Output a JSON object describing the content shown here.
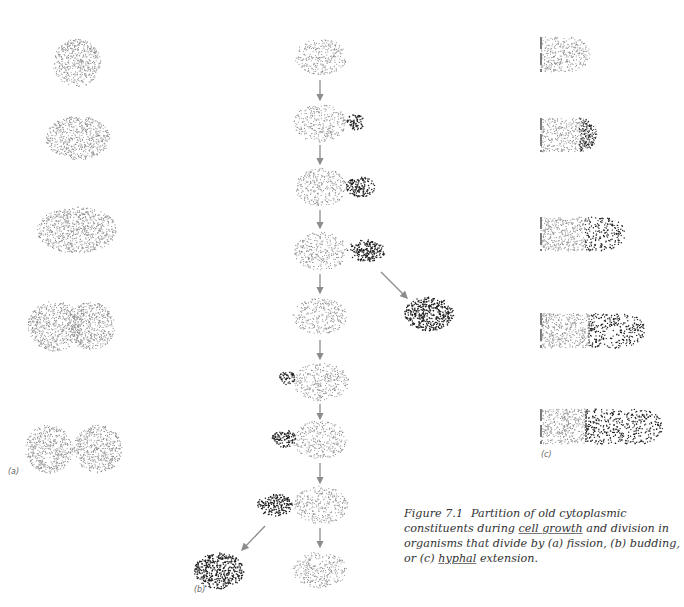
{
  "figure": {
    "number": "Figure 7.1",
    "caption_parts": [
      {
        "text": "Partition of old cytoplasmic constituents during ",
        "u": false
      },
      {
        "text": "cell growth",
        "u": true
      },
      {
        "text": " and division in organisms that divide by (a) fission, (b) budding, or (c) ",
        "u": false
      },
      {
        "text": "hyphal",
        "u": true
      },
      {
        "text": " extension.",
        "u": false
      }
    ],
    "caption_lines": [
      "Partition of old cytoplasmic",
      "constituents during cell growth and",
      "division in organisms that divide by (a)",
      "fission, (b) budding, or (c) hyphal extension."
    ]
  },
  "panels": {
    "a": {
      "label": "(a)",
      "label_x": 8,
      "label_y": 475
    },
    "b": {
      "label": "(b)",
      "label_x": 194,
      "label_y": 593
    },
    "c": {
      "label": "(c)",
      "label_x": 541,
      "label_y": 458
    }
  },
  "colors": {
    "old_dots": "#8a8a8a",
    "new_dots": "#1e1e1e",
    "arrow": "#8c8c8c",
    "wall": "#444444",
    "text": "#333333"
  },
  "shapes": {
    "fission": [
      {
        "cx": 77,
        "cy": 63,
        "rx": 24,
        "ry": 24,
        "type": "old"
      },
      {
        "cx": 78,
        "cy": 138,
        "rx": 32,
        "ry": 22,
        "type": "old"
      },
      {
        "cx": 77,
        "cy": 230,
        "rx": 40,
        "ry": 23,
        "type": "old"
      },
      {
        "cx": 55,
        "cy": 326,
        "rx": 27,
        "ry": 25,
        "type": "old"
      },
      {
        "cx": 91,
        "cy": 326,
        "rx": 24,
        "ry": 24,
        "type": "old"
      },
      {
        "cx": 49,
        "cy": 449,
        "rx": 24,
        "ry": 24,
        "type": "old"
      },
      {
        "cx": 98,
        "cy": 449,
        "rx": 24,
        "ry": 24,
        "type": "old"
      }
    ],
    "budding": [
      {
        "cx": 321,
        "cy": 57,
        "rx": 26,
        "ry": 18,
        "type": "old"
      },
      {
        "cx": 320,
        "cy": 123,
        "rx": 26,
        "ry": 19,
        "type": "old"
      },
      {
        "cx": 356,
        "cy": 122,
        "rx": 9,
        "ry": 8,
        "type": "new"
      },
      {
        "cx": 321,
        "cy": 187,
        "rx": 26,
        "ry": 19,
        "type": "old"
      },
      {
        "cx": 361,
        "cy": 187,
        "rx": 15,
        "ry": 10,
        "type": "new"
      },
      {
        "cx": 321,
        "cy": 251,
        "rx": 27,
        "ry": 19,
        "type": "old"
      },
      {
        "cx": 366,
        "cy": 251,
        "rx": 19,
        "ry": 11,
        "type": "new"
      },
      {
        "cx": 320,
        "cy": 316,
        "rx": 27,
        "ry": 18,
        "type": "old"
      },
      {
        "cx": 429,
        "cy": 314,
        "rx": 25,
        "ry": 17,
        "type": "new"
      },
      {
        "cx": 321,
        "cy": 382,
        "rx": 28,
        "ry": 19,
        "type": "old"
      },
      {
        "cx": 287,
        "cy": 378,
        "rx": 8,
        "ry": 7,
        "type": "new"
      },
      {
        "cx": 320,
        "cy": 440,
        "rx": 27,
        "ry": 19,
        "type": "old"
      },
      {
        "cx": 284,
        "cy": 439,
        "rx": 12,
        "ry": 9,
        "type": "new"
      },
      {
        "cx": 321,
        "cy": 505,
        "rx": 27,
        "ry": 19,
        "type": "old"
      },
      {
        "cx": 275,
        "cy": 505,
        "rx": 18,
        "ry": 11,
        "type": "new"
      },
      {
        "cx": 219,
        "cy": 571,
        "rx": 25,
        "ry": 18,
        "type": "new"
      },
      {
        "cx": 320,
        "cy": 570,
        "rx": 27,
        "ry": 18,
        "type": "old"
      }
    ],
    "arrows": [
      {
        "x1": 320,
        "y1": 80,
        "x2": 320,
        "y2": 100
      },
      {
        "x1": 320,
        "y1": 145,
        "x2": 320,
        "y2": 164
      },
      {
        "x1": 320,
        "y1": 210,
        "x2": 320,
        "y2": 228
      },
      {
        "x1": 320,
        "y1": 274,
        "x2": 320,
        "y2": 293
      },
      {
        "x1": 381,
        "y1": 272,
        "x2": 407,
        "y2": 298
      },
      {
        "x1": 320,
        "y1": 340,
        "x2": 320,
        "y2": 359
      },
      {
        "x1": 320,
        "y1": 404,
        "x2": 320,
        "y2": 419
      },
      {
        "x1": 320,
        "y1": 463,
        "x2": 320,
        "y2": 483
      },
      {
        "x1": 265,
        "y1": 526,
        "x2": 242,
        "y2": 550
      },
      {
        "x1": 320,
        "y1": 528,
        "x2": 320,
        "y2": 547
      }
    ],
    "hyphae": [
      {
        "x": 541,
        "y": 37,
        "w": 28,
        "h": 35,
        "tip_w": 21,
        "old_w": 49,
        "new_start": null
      },
      {
        "x": 541,
        "y": 118,
        "w": 50,
        "h": 34,
        "tip_w": 14,
        "old_w": 50,
        "new_start": 49
      },
      {
        "x": 541,
        "y": 217,
        "w": 82,
        "h": 34,
        "tip_w": 0,
        "old_w": 44,
        "new_start": 44
      },
      {
        "x": 541,
        "y": 313,
        "w": 102,
        "h": 35,
        "tip_w": 0,
        "old_w": 48,
        "new_start": 48
      },
      {
        "x": 541,
        "y": 409,
        "w": 120,
        "h": 35,
        "tip_w": 0,
        "old_w": 45,
        "new_start": 45
      }
    ]
  }
}
